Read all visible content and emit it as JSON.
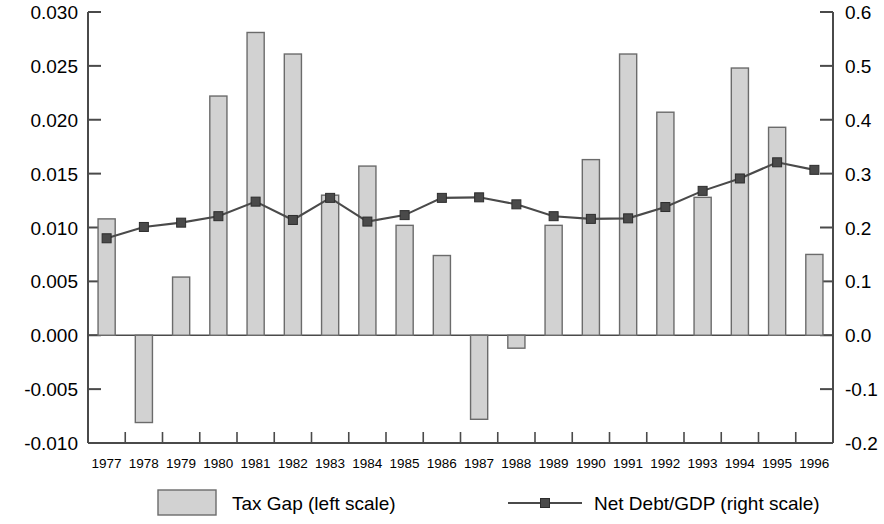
{
  "chart_data": {
    "type": "bar",
    "title": "",
    "subtitle": "",
    "xlabel": "",
    "categories": [
      "1977",
      "1978",
      "1979",
      "1980",
      "1981",
      "1982",
      "1983",
      "1984",
      "1985",
      "1986",
      "1987",
      "1988",
      "1989",
      "1990",
      "1991",
      "1992",
      "1993",
      "1994",
      "1995",
      "1996"
    ],
    "grid": false,
    "legend_position": "bottom",
    "axes": {
      "left": {
        "label": "",
        "ylim": [
          -0.01,
          0.03
        ],
        "ticks": [
          -0.01,
          -0.005,
          0.0,
          0.005,
          0.01,
          0.015,
          0.02,
          0.025,
          0.03
        ],
        "tick_labels": [
          "-0.010",
          "-0.005",
          "0.000",
          "0.005",
          "0.010",
          "0.015",
          "0.020",
          "0.025",
          "0.030"
        ]
      },
      "right": {
        "label": "",
        "ylim": [
          -0.2,
          0.6
        ],
        "ticks": [
          -0.2,
          -0.1,
          0.0,
          0.1,
          0.2,
          0.3,
          0.4,
          0.5,
          0.6
        ],
        "tick_labels": [
          "-0.2",
          "-0.1",
          "0.0",
          "0.1",
          "0.2",
          "0.3",
          "0.4",
          "0.5",
          "0.6"
        ]
      }
    },
    "series": [
      {
        "name": "Tax Gap (left scale)",
        "type": "bar",
        "axis": "left",
        "color": "#d2d2d2",
        "edge_color": "#6b6b6b",
        "values": [
          0.0108,
          -0.0081,
          0.0054,
          0.0222,
          0.0281,
          0.0261,
          0.013,
          0.0157,
          0.0102,
          0.0074,
          -0.0078,
          -0.0012,
          0.0102,
          0.0163,
          0.0261,
          0.0207,
          0.0128,
          0.0248,
          0.0193,
          0.0075
        ]
      },
      {
        "name": "Net Debt/GDP (right scale)",
        "type": "line",
        "axis": "right",
        "color": "#4a4a4a",
        "marker": "square",
        "values": [
          0.18,
          0.201,
          0.209,
          0.221,
          0.248,
          0.214,
          0.255,
          0.211,
          0.223,
          0.255,
          0.256,
          0.243,
          0.221,
          0.216,
          0.217,
          0.238,
          0.268,
          0.291,
          0.321,
          0.307
        ]
      }
    ]
  },
  "legend": {
    "items": [
      {
        "label": "Tax Gap (left scale)",
        "marker": "bar-swatch",
        "color": "#d2d2d2"
      },
      {
        "label": "Net Debt/GDP (right scale)",
        "marker": "line-square",
        "color": "#4a4a4a"
      }
    ]
  }
}
